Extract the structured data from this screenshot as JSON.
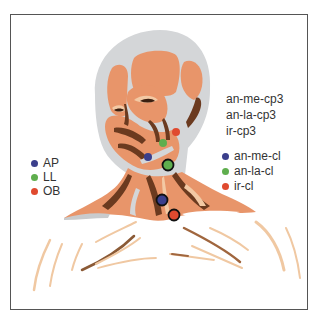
{
  "figure": {
    "colors": {
      "skin_muscle": "#E8956A",
      "muscle_dark": "#6B3A1F",
      "muscle_light": "#F3C9A4",
      "bone_gray": "#D4D6D8",
      "frame_border": "#555555"
    }
  },
  "labels_top_right": [
    {
      "text": "an-me-cp3"
    },
    {
      "text": "an-la-cp3"
    },
    {
      "text": "ir-cp3"
    }
  ],
  "legend_left": {
    "items": [
      {
        "label": "AP",
        "color": "#3B3F8C"
      },
      {
        "label": "LL",
        "color": "#5FAE4E"
      },
      {
        "label": "OB",
        "color": "#E04A2F"
      }
    ]
  },
  "legend_right": {
    "items": [
      {
        "label": "an-me-cl",
        "color": "#3B3F8C"
      },
      {
        "label": "an-la-cl",
        "color": "#5FAE4E"
      },
      {
        "label": "ir-cl",
        "color": "#E04A2F"
      }
    ]
  },
  "markers": [
    {
      "name": "AP-face",
      "color": "#3B3F8C",
      "x": 148,
      "y": 157,
      "r": 4,
      "outlined": false
    },
    {
      "name": "LL-face",
      "color": "#5FAE4E",
      "x": 163,
      "y": 143,
      "r": 4,
      "outlined": false
    },
    {
      "name": "OB-face",
      "color": "#E04A2F",
      "x": 176,
      "y": 132,
      "r": 4,
      "outlined": false
    },
    {
      "name": "an-la-cl",
      "color": "#5FAE4E",
      "x": 168,
      "y": 165,
      "r": 5,
      "outlined": true
    },
    {
      "name": "an-me-cl",
      "color": "#3B3F8C",
      "x": 162,
      "y": 200,
      "r": 5,
      "outlined": true
    },
    {
      "name": "ir-cl",
      "color": "#E04A2F",
      "x": 174,
      "y": 215,
      "r": 5,
      "outlined": true
    }
  ]
}
